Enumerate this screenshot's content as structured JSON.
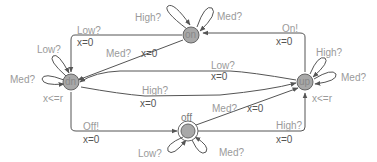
{
  "diagram": {
    "type": "timed-automaton",
    "colors": {
      "edge": "#555555",
      "node_fill": "#a8a8a8",
      "node_stroke": "#666666",
      "label": "#9a9a9a"
    },
    "states": [
      {
        "id": "on",
        "name": "on",
        "initial": false,
        "invariant": ""
      },
      {
        "id": "dn",
        "name": "dn",
        "initial": false,
        "invariant": "x<=r"
      },
      {
        "id": "up",
        "name": "up",
        "initial": false,
        "invariant": "x<=r"
      },
      {
        "id": "off",
        "name": "off",
        "initial": true,
        "invariant": ""
      }
    ],
    "self_loops": {
      "on_high": "High?",
      "on_med": "Med?",
      "dn_low": "Low?",
      "dn_med": "Med?",
      "up_high": "High?",
      "up_med": "Med?",
      "off_low": "Low?",
      "off_med": "Med?"
    },
    "edges": {
      "on_dn": {
        "sync": "Low?",
        "update": "x=0"
      },
      "on_dn_med": {
        "sync": "Med?",
        "update": "x=0"
      },
      "up_on": {
        "sync": "On!",
        "update": "x=0"
      },
      "up_dn": {
        "sync": "Low?",
        "update": "x=0"
      },
      "dn_up": {
        "sync": "High?",
        "update": "x=0"
      },
      "dn_off": {
        "sync": "Off!",
        "update": "x=0"
      },
      "off_up_med": {
        "sync": "Med?",
        "update": "x=0"
      },
      "off_up_high": {
        "sync": "High?",
        "update": "x=0"
      }
    }
  }
}
